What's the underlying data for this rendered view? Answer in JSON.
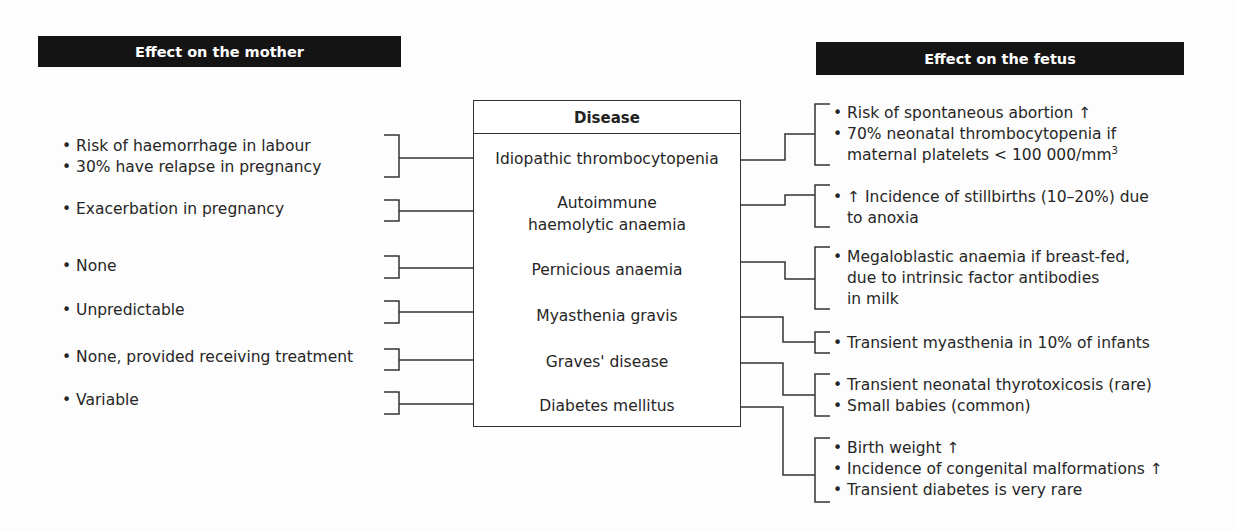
{
  "headers": {
    "mother": "Effect on the mother",
    "fetus": "Effect on the fetus"
  },
  "disease_box": {
    "title": "Disease",
    "diseases": [
      "Idiopathic thrombocytopenia",
      "Autoimmune",
      "haemolytic anaemia",
      "Pernicious anaemia",
      "Myasthenia gravis",
      "Graves' disease",
      "Diabetes mellitus"
    ]
  },
  "mother_effects": [
    [
      "• Risk of haemorrhage in labour",
      "• 30% have relapse in pregnancy"
    ],
    [
      "• Exacerbation in pregnancy"
    ],
    [
      "• None"
    ],
    [
      "• Unpredictable"
    ],
    [
      "• None, provided receiving treatment"
    ],
    [
      "• Variable"
    ]
  ],
  "fetus_effects": [
    [
      "• Risk of spontaneous abortion ↑",
      "• 70% neonatal thrombocytopenia if",
      "maternal platelets < 100 000/mm",
      "3"
    ],
    [
      "• ↑ Incidence of stillbirths (10–20%) due",
      "to anoxia"
    ],
    [
      "• Megaloblastic anaemia if breast-fed,",
      "due to intrinsic factor antibodies",
      "in milk"
    ],
    [
      "• Transient myasthenia in 10% of infants"
    ],
    [
      "• Transient neonatal thyrotoxicosis (rare)",
      "• Small babies (common)"
    ],
    [
      "• Birth weight ↑",
      "• Incidence of congenital malformations ↑",
      "• Transient diabetes is very rare"
    ]
  ],
  "colors": {
    "header_bg": "#141414",
    "header_text": "#ffffff",
    "line": "#333333",
    "text": "#262626"
  }
}
